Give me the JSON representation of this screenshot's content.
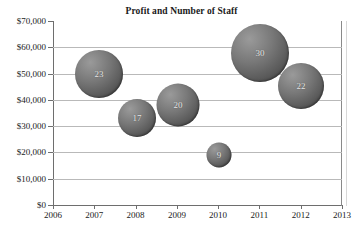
{
  "chart_data": {
    "type": "scatter",
    "title": "Profit and Number of Staff",
    "xlabel": "",
    "ylabel": "",
    "grid": true,
    "legend": "none",
    "xlim": [
      2006,
      2013
    ],
    "ylim": [
      0,
      70000
    ],
    "x_tick_labels": [
      "2006",
      "2007",
      "2008",
      "2009",
      "2010",
      "2011",
      "2012",
      "2013"
    ],
    "x_ticks": [
      2006,
      2007,
      2008,
      2009,
      2010,
      2011,
      2012,
      2013
    ],
    "y_tick_labels": [
      "$70,000",
      "$60,000",
      "$50,000",
      "$40,000",
      "$30,000",
      "$20,000",
      "$10,000",
      "$0"
    ],
    "y_ticks": [
      70000,
      60000,
      50000,
      40000,
      30000,
      20000,
      10000,
      0
    ],
    "bubble_value_is": "number of staff",
    "points": [
      {
        "x": 2007,
        "y": 50000,
        "size": 23,
        "label": "23"
      },
      {
        "x": 2008,
        "y": 35000,
        "size": 17,
        "label": "17"
      },
      {
        "x": 2009,
        "y": 40000,
        "size": 20,
        "label": "20"
      },
      {
        "x": 2010,
        "y": 19000,
        "size": 9,
        "label": "9"
      },
      {
        "x": 2011,
        "y": 60000,
        "size": 30,
        "label": "30"
      },
      {
        "x": 2012,
        "y": 45000,
        "size": 22,
        "label": "22"
      }
    ],
    "colors": {
      "bubble_light": "#9a9a9a",
      "bubble_dark": "#434343",
      "bubble_text": "#e9e9e9",
      "gridline": "#b9b9b9",
      "axis": "#6e6e6e",
      "text": "#1a1a1a",
      "background": "#ffffff"
    }
  },
  "layout": {
    "plot": {
      "left": 53,
      "top": 21,
      "width": 289,
      "height": 184
    },
    "x_pixels": [
      53,
      94.3,
      135.6,
      176.9,
      218.1,
      259.4,
      300.7,
      342
    ],
    "y_pixels": [
      21,
      47.3,
      73.6,
      99.9,
      126.1,
      152.4,
      178.7,
      205
    ],
    "bubble_px": [
      {
        "cx": 99,
        "cy": 74,
        "d": 48,
        "i": 0
      },
      {
        "cx": 137,
        "cy": 118,
        "d": 38,
        "i": 1
      },
      {
        "cx": 178,
        "cy": 105,
        "d": 43,
        "i": 2
      },
      {
        "cx": 219,
        "cy": 155,
        "d": 25,
        "i": 3
      },
      {
        "cx": 260,
        "cy": 53,
        "d": 58,
        "i": 4
      },
      {
        "cx": 301,
        "cy": 86,
        "d": 46,
        "i": 5
      }
    ]
  }
}
